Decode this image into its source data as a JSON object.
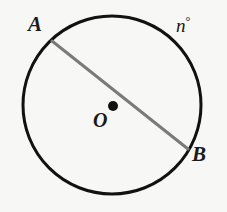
{
  "figure": {
    "kind": "circle-with-diameter",
    "background_color": "#f7f7f5",
    "stroke_color": "#111111",
    "chord_color": "#7a7a7a",
    "dot_color": "#111111"
  },
  "labels": {
    "point_a": "A",
    "point_b": "B",
    "center": "O",
    "arc_measure": "n",
    "degree_symbol": "°"
  },
  "geometry": {
    "circle": {
      "cx": 112,
      "cy": 105,
      "r": 89,
      "stroke_width": 3
    },
    "center_dot": {
      "cx": 113,
      "cy": 106,
      "r": 5
    },
    "diameter": {
      "x1": 52,
      "y1": 41,
      "x2": 188,
      "y2": 149,
      "stroke_width": 3
    }
  }
}
